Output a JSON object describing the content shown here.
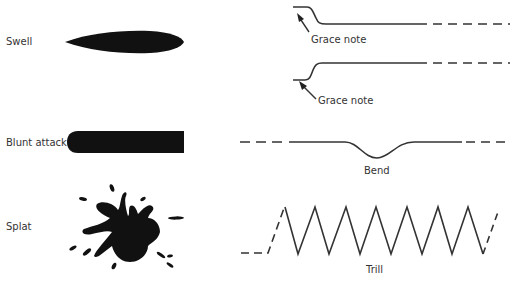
{
  "diagram": {
    "left_items": [
      {
        "label": "Swell",
        "shape": "swell-shape"
      },
      {
        "label": "Blunt attack",
        "shape": "blunt-attack-shape"
      },
      {
        "label": "Splat",
        "shape": "splat-shape"
      }
    ],
    "right_items": [
      {
        "label": "Grace note",
        "shape": "grace-note-down-curve"
      },
      {
        "label": "Grace note",
        "shape": "grace-note-up-curve"
      },
      {
        "label": "Bend",
        "shape": "bend-curve"
      },
      {
        "label": "Trill",
        "shape": "trill-zigzag"
      }
    ],
    "colors": {
      "ink": "#111111",
      "line": "#333333",
      "background": "#ffffff"
    }
  }
}
